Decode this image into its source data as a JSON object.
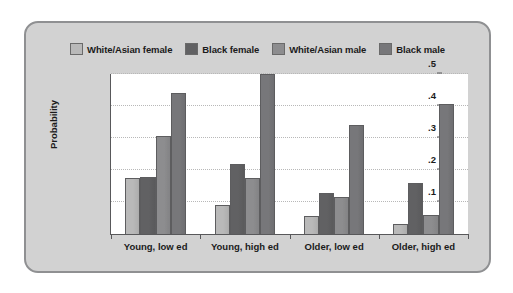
{
  "chart_data": {
    "type": "bar",
    "title": "",
    "subtitle": "",
    "xlabel": "",
    "ylabel": "Probability",
    "categories": [
      "Young, low ed",
      "Young, high ed",
      "Older, low ed",
      "Older, high ed"
    ],
    "series": [
      {
        "name": "White/Asian female",
        "color": "#b9b9b9",
        "values": [
          0.175,
          0.09,
          0.055,
          0.03
        ]
      },
      {
        "name": "Black female",
        "color": "#616163",
        "values": [
          0.177,
          0.22,
          0.128,
          0.16
        ]
      },
      {
        "name": "White/Asian male",
        "color": "#8d8d8f",
        "values": [
          0.305,
          0.175,
          0.115,
          0.058
        ]
      },
      {
        "name": "Black male",
        "color": "#77777a",
        "values": [
          0.44,
          0.5,
          0.34,
          0.405
        ]
      }
    ],
    "ylim": [
      0,
      0.5
    ],
    "ytick_labels": [
      ".0",
      ".1",
      ".2",
      ".3",
      ".4",
      ".5"
    ],
    "ytick_values": [
      0,
      0.1,
      0.2,
      0.3,
      0.4,
      0.5
    ],
    "grid": true,
    "legend_position": "top-center",
    "plot_background": "#ffffff",
    "figure_background": "#d2d2d2",
    "axis_color": "#58585a",
    "grid_color": "#b8b8b8"
  }
}
